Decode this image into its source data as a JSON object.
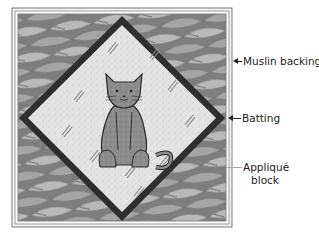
{
  "figure": {
    "colors": {
      "background": "#ffffff",
      "muslin_border": "#f2f2f2",
      "frame_line": "#7a7a7a",
      "print_fabric_base": "#8d8d8d",
      "print_fabric_light": "#bdbdbd",
      "print_fabric_dark": "#6a6a6a",
      "diamond_frame": "#2e2e2e",
      "diamond_fill": "#e3e3e3",
      "cat_fill": "#8a8a8a",
      "cat_outline": "#2a2a2a",
      "label_text": "#222222"
    },
    "illustration": {
      "appliqué_motif": "seated cat",
      "background_motif": "safety pins"
    }
  },
  "labels": [
    {
      "id": "muslin",
      "text": "Muslin backing"
    },
    {
      "id": "batting",
      "text": "Batting"
    },
    {
      "id": "applique_line1",
      "text": "Appliqué"
    },
    {
      "id": "applique_line2",
      "text": "block"
    }
  ]
}
